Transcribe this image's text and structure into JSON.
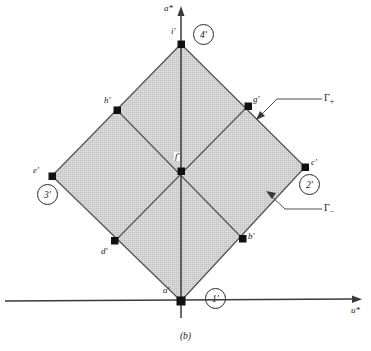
{
  "figure": {
    "caption": "(b)",
    "axes": {
      "x_label": "u*",
      "y_label": "a*",
      "origin_label": "a'"
    },
    "points": [
      {
        "id": "a-prime",
        "label": "a'",
        "x": 181,
        "y": 301,
        "lx": 163,
        "ly": 289
      },
      {
        "id": "b-prime",
        "label": "b'",
        "x": 243,
        "y": 239,
        "lx": 248,
        "ly": 237
      },
      {
        "id": "c-prime",
        "label": "c'",
        "x": 305,
        "y": 167,
        "lx": 311,
        "ly": 161
      },
      {
        "id": "d-prime",
        "label": "d'",
        "x": 115,
        "y": 241,
        "lx": 102,
        "ly": 250
      },
      {
        "id": "e-prime",
        "label": "e'",
        "x": 52,
        "y": 176,
        "lx": 36,
        "ly": 169
      },
      {
        "id": "f-prime",
        "label": "f'",
        "x": 181,
        "y": 171,
        "lx": 174,
        "ly": 155
      },
      {
        "id": "g-prime",
        "label": "g'",
        "x": 248,
        "y": 106,
        "lx": 253,
        "ly": 98
      },
      {
        "id": "h-prime",
        "label": "h'",
        "x": 117,
        "y": 110,
        "lx": 105,
        "ly": 99
      },
      {
        "id": "i-prime",
        "label": "i'",
        "x": 181,
        "y": 44,
        "lx": 172,
        "ly": 30
      }
    ],
    "regions": [
      {
        "id": "region-1",
        "label": "1'",
        "cx": 215,
        "cy": 298
      },
      {
        "id": "region-2",
        "label": "2'",
        "cx": 309,
        "cy": 184
      },
      {
        "id": "region-3",
        "label": "3'",
        "cx": 47,
        "cy": 194
      },
      {
        "id": "region-4",
        "label": "4'",
        "cx": 203,
        "cy": 34
      }
    ],
    "annotations": [
      {
        "id": "gamma-plus",
        "symbol": "Γ",
        "subscript": "+",
        "lx": 324,
        "ly": 97
      },
      {
        "id": "gamma-minus",
        "symbol": "Γ",
        "subscript": "−",
        "lx": 324,
        "ly": 207
      }
    ],
    "colors": {
      "shading": "#d6d6d6",
      "stroke": "#4a4a4a",
      "axis": "#3a3a3a",
      "point": "#111111"
    },
    "geometry": {
      "diamond": "181,44 305,167 181,301 52,176",
      "inner_cross": "a'-i' vertical / e'-c' horizontal through f'"
    }
  }
}
